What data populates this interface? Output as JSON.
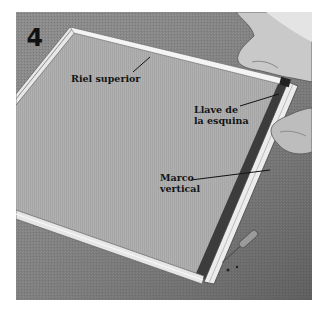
{
  "figure": {
    "step_number": "4",
    "labels": {
      "top_rail": "Riel superior",
      "corner_key_line1": "Llave de",
      "corner_key_line2": "la esquina",
      "vertical_frame_line1": "Marco",
      "vertical_frame_line2": "vertical"
    },
    "colors": {
      "background": "#ffffff",
      "floor": "#7a7a7a",
      "screen_mesh": "#a9a9a9",
      "frame_highlight": "#f2f2f2",
      "label_text": "#141414"
    }
  }
}
